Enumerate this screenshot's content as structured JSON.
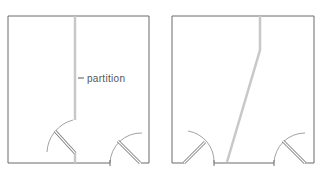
{
  "diagram": {
    "plans": [
      {
        "id": "straight-partition-plan",
        "partition_style": "straight"
      },
      {
        "id": "angled-partition-plan",
        "partition_style": "angled"
      }
    ],
    "annotation": {
      "label": "partition"
    },
    "colors": {
      "wall": "#6b6b6b",
      "partition": "#c8c8c8",
      "door_arc": "#8a8a8a",
      "door_leaf": "#7a7a7a",
      "label": "#555555"
    }
  }
}
